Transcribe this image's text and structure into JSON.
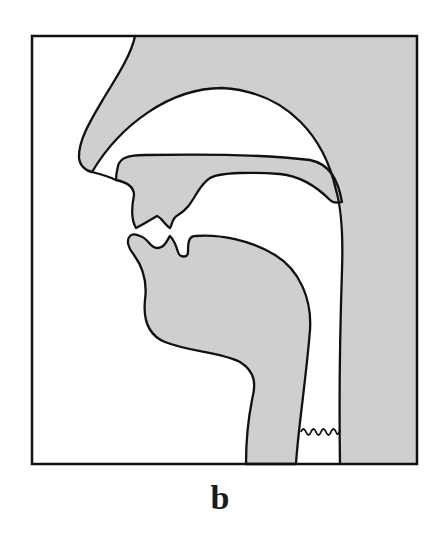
{
  "figure": {
    "caption": "b",
    "colors": {
      "tissue_fill": "#cfcfcf",
      "outline": "#111111",
      "background": "#ffffff"
    },
    "parts": [
      {
        "id": "nose",
        "label": "nose"
      },
      {
        "id": "nasal-cavity",
        "label": "nasal cavity"
      },
      {
        "id": "hard-palate",
        "label": "palate / upper jaw"
      },
      {
        "id": "upper-lip",
        "label": "upper lip"
      },
      {
        "id": "upper-teeth",
        "label": "upper teeth"
      },
      {
        "id": "lower-lip",
        "label": "lower lip"
      },
      {
        "id": "lower-teeth",
        "label": "lower teeth"
      },
      {
        "id": "tongue",
        "label": "tongue / lower jaw"
      },
      {
        "id": "pharynx",
        "label": "pharynx"
      },
      {
        "id": "vocal-folds",
        "label": "vocal folds (voicing)"
      },
      {
        "id": "posterior-wall",
        "label": "posterior pharyngeal wall"
      }
    ]
  }
}
